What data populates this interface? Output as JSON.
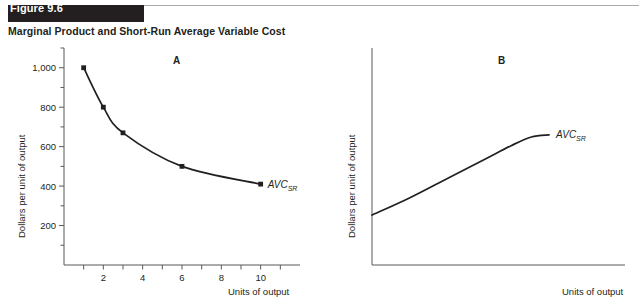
{
  "figure": {
    "tag": "Figure 9.6",
    "subtitle": "Marginal Product and Short-Run Average Variable Cost"
  },
  "panels": {
    "a": {
      "letter": "A",
      "y_axis_title": "Dollars per unit of output",
      "x_axis_title": "Units of output",
      "curve_label": "AVC",
      "curve_label_sub": "SR"
    },
    "b": {
      "letter": "B",
      "y_axis_title": "Dollars per unit of output",
      "x_axis_title": "Units of output",
      "curve_label": "AVC",
      "curve_label_sub": "SR"
    }
  },
  "chart_data": [
    {
      "type": "line",
      "panel": "A",
      "title": "Short-Run Average Variable Cost (declining region)",
      "xlabel": "Units of output",
      "ylabel": "Dollars per unit of output",
      "xlim": [
        0,
        12
      ],
      "ylim": [
        0,
        1100
      ],
      "xticks": [
        1,
        2,
        3,
        4,
        5,
        6,
        7,
        8,
        9,
        10,
        11
      ],
      "xticklabels": [
        "",
        "2",
        "",
        "4",
        "",
        "6",
        "",
        "8",
        "",
        "10",
        ""
      ],
      "ytick_labels": [
        "200",
        "400",
        "600",
        "800",
        "1,000"
      ],
      "yticks": [
        200,
        400,
        600,
        800,
        1000
      ],
      "yticks_minor": [
        100,
        300,
        500,
        700,
        900,
        1100
      ],
      "grid": false,
      "legend": "none",
      "markers": true,
      "series": [
        {
          "name": "AVC_SR",
          "x": [
            1,
            2,
            3,
            6,
            10
          ],
          "values": [
            1000,
            800,
            670,
            500,
            410
          ]
        }
      ]
    },
    {
      "type": "line",
      "panel": "B",
      "title": "Short-Run Average Variable Cost (rising region)",
      "xlabel": "Units of output",
      "ylabel": "Dollars per unit of output",
      "xlim": [
        0,
        10
      ],
      "ylim": [
        0,
        10
      ],
      "xticks": [],
      "xticklabels": [],
      "ytick_labels": [],
      "yticks": [],
      "grid": false,
      "legend": "none",
      "markers": false,
      "series": [
        {
          "name": "AVC_SR",
          "x": [
            0,
            1.5,
            3,
            4.5,
            5.5,
            6.3,
            7.0
          ],
          "values": [
            2.3,
            3.1,
            4.0,
            4.9,
            5.5,
            5.9,
            6.0
          ]
        }
      ]
    }
  ]
}
